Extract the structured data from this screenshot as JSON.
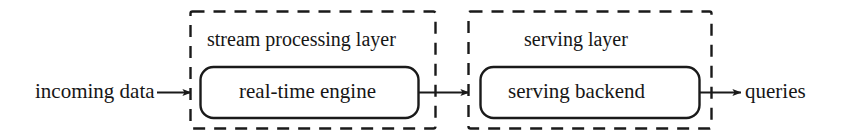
{
  "diagram": {
    "type": "block-flow-diagram",
    "background_color": "#ffffff",
    "stroke_color": "#1a1a1a",
    "groups": [
      {
        "id": "stream-processing-layer",
        "label": "stream processing layer",
        "border_style": "dashed",
        "box": {
          "id": "real-time-engine",
          "label": "real-time engine",
          "border_style": "solid",
          "shape": "rounded-rectangle"
        }
      },
      {
        "id": "serving-layer",
        "label": "serving layer",
        "border_style": "dashed",
        "box": {
          "id": "serving-backend",
          "label": "serving backend",
          "border_style": "solid",
          "shape": "rounded-rectangle"
        }
      }
    ],
    "inputs": [
      {
        "id": "incoming-data",
        "label": "incoming data"
      }
    ],
    "outputs": [
      {
        "id": "queries",
        "label": "queries"
      }
    ],
    "connectors": [
      {
        "id": "arrow-incoming-to-stream",
        "from": "incoming data",
        "to": "stream processing layer",
        "style": "solid-arrow"
      },
      {
        "id": "arrow-stream-to-serving",
        "from": "stream processing layer",
        "to": "serving layer",
        "style": "solid-arrow"
      },
      {
        "id": "arrow-serving-to-queries",
        "from": "serving layer",
        "to": "queries",
        "style": "solid-arrow"
      }
    ]
  }
}
